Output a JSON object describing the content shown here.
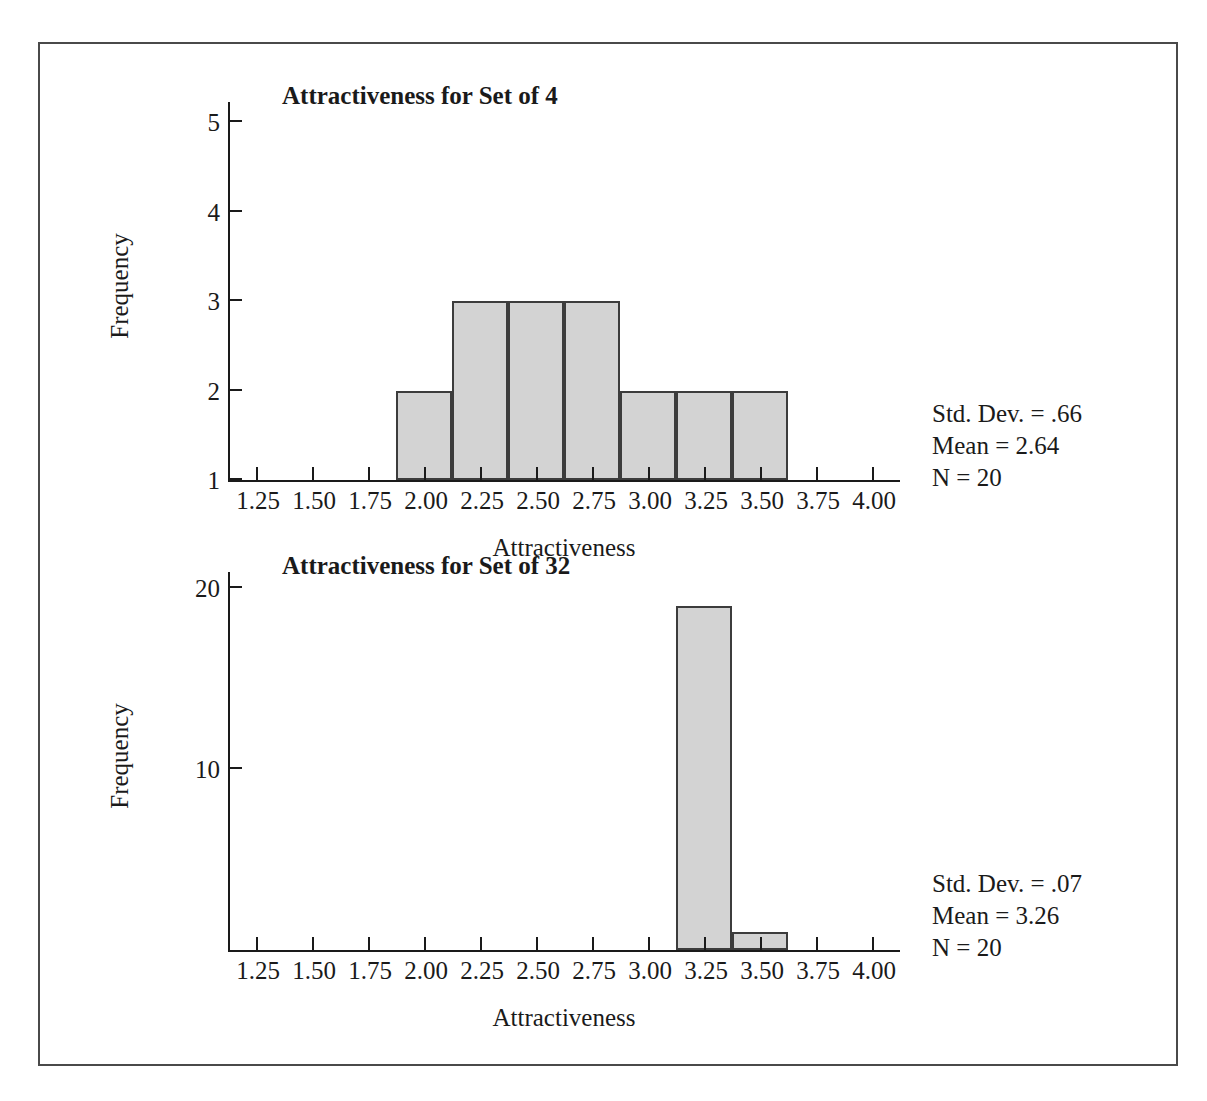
{
  "figure": {
    "border_color": "#4a4a4a",
    "background": "#ffffff",
    "bar_fill": "#d3d3d3",
    "bar_stroke": "#3c3c3c",
    "axis_color": "#1a1a1a"
  },
  "chart_data": [
    {
      "type": "bar",
      "title": "Attractiveness for Set of 4",
      "xlabel": "Attractiveness",
      "ylabel": "Frequency",
      "xlim": [
        1.125,
        4.125
      ],
      "ylim": [
        1,
        5.25
      ],
      "grid": false,
      "legend": "none",
      "xticks": [
        "1.25",
        "1.50",
        "1.75",
        "2.00",
        "2.25",
        "2.50",
        "2.75",
        "3.00",
        "3.25",
        "3.50",
        "3.75",
        "4.00"
      ],
      "xtick_values": [
        1.25,
        1.5,
        1.75,
        2.0,
        2.25,
        2.5,
        2.75,
        3.0,
        3.25,
        3.5,
        3.75,
        4.0
      ],
      "yticks": [
        "1",
        "2",
        "3",
        "4",
        "5"
      ],
      "ytick_values": [
        1,
        2,
        3,
        4,
        5
      ],
      "bin_width": 0.25,
      "categories": [
        "2.00",
        "2.25",
        "2.50",
        "2.75",
        "3.00",
        "3.25",
        "3.50"
      ],
      "bin_centers": [
        2.0,
        2.25,
        2.5,
        2.75,
        3.0,
        3.25,
        3.5
      ],
      "values": [
        2,
        3,
        3,
        3,
        2,
        2,
        2
      ],
      "annotations": {
        "std_dev": "Std. Dev. = .66",
        "mean": "Mean = 2.64",
        "n": "N = 20"
      }
    },
    {
      "type": "bar",
      "title": "Attractiveness for Set of 32",
      "xlabel": "Attractiveness",
      "ylabel": "Frequency",
      "xlim": [
        1.125,
        4.125
      ],
      "ylim": [
        0,
        21
      ],
      "grid": false,
      "legend": "none",
      "xticks": [
        "1.25",
        "1.50",
        "1.75",
        "2.00",
        "2.25",
        "2.50",
        "2.75",
        "3.00",
        "3.25",
        "3.50",
        "3.75",
        "4.00"
      ],
      "xtick_values": [
        1.25,
        1.5,
        1.75,
        2.0,
        2.25,
        2.5,
        2.75,
        3.0,
        3.25,
        3.5,
        3.75,
        4.0
      ],
      "yticks": [
        "10",
        "20"
      ],
      "ytick_values": [
        10,
        20
      ],
      "bin_width": 0.25,
      "categories": [
        "3.25",
        "3.50"
      ],
      "bin_centers": [
        3.25,
        3.5
      ],
      "values": [
        19,
        1
      ],
      "annotations": {
        "std_dev": "Std. Dev. = .07",
        "mean": "Mean = 3.26",
        "n": "N = 20"
      }
    }
  ]
}
